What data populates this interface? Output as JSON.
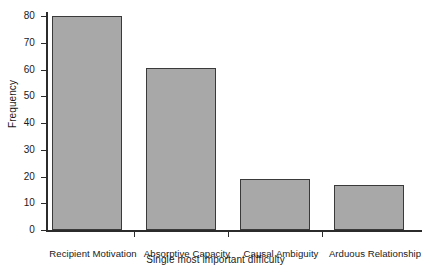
{
  "chart_data": {
    "type": "bar",
    "title": "",
    "subtitle": "",
    "xlabel": "Single most important difficulty",
    "ylabel": "Frequency",
    "categories": [
      "Recipient Motivation",
      "Absorptive Capacity",
      "Causal Ambiguity",
      "Arduous Relationship"
    ],
    "values": [
      80,
      60.5,
      19,
      17
    ],
    "ylim": [
      0,
      80
    ],
    "ytick_labels": [
      "0",
      "10",
      "20",
      "30",
      "40",
      "50",
      "60",
      "70",
      "80"
    ],
    "ytick_values": [
      0,
      10,
      20,
      30,
      40,
      50,
      60,
      70,
      80
    ],
    "grid": false,
    "legend": null,
    "bar_fill_color": "#a8a8a8",
    "bar_edge_color": "#3a3a3a",
    "axis_color": "#2b2b2b",
    "background_color": "#ffffff"
  }
}
